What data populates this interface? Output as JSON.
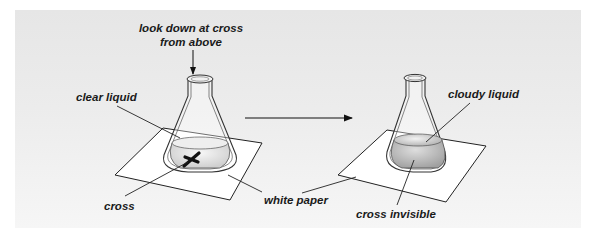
{
  "diagram": {
    "left_setup": {
      "labels": {
        "top_instruction_line1": "look down at cross",
        "top_instruction_line2": "from above",
        "liquid": "clear liquid",
        "mark": "cross",
        "paper": "white paper"
      }
    },
    "right_setup": {
      "labels": {
        "liquid": "cloudy liquid",
        "mark": "cross invisible"
      }
    },
    "colors": {
      "background_panel": "#ececec",
      "paper": "#ffffff",
      "outline": "#222222",
      "clear_liquid": "#e2e2e2",
      "cloudy_liquid": "#b9b9b9"
    }
  }
}
